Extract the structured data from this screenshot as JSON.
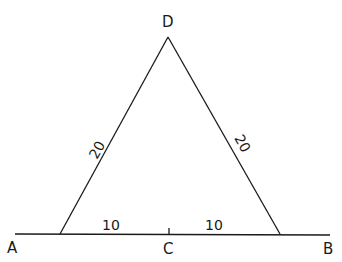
{
  "diagram": {
    "points": {
      "A": {
        "label": "A"
      },
      "B": {
        "label": "B"
      },
      "C": {
        "label": "C"
      },
      "D": {
        "label": "D"
      }
    },
    "lengths": {
      "left_side": "20",
      "right_side": "20",
      "left_base": "10",
      "right_base": "10"
    },
    "line_color": "#1a1a1a"
  }
}
